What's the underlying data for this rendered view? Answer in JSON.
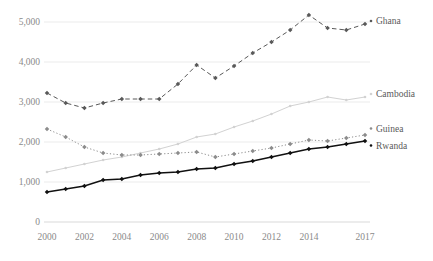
{
  "chart_data": {
    "type": "line",
    "title": "",
    "xlabel": "",
    "ylabel": "",
    "x": [
      2000,
      2001,
      2002,
      2003,
      2004,
      2005,
      2006,
      2007,
      2008,
      2009,
      2010,
      2011,
      2012,
      2013,
      2014,
      2015,
      2016,
      2017
    ],
    "xlim": [
      2000,
      2017
    ],
    "ylim": [
      0,
      5400
    ],
    "grid": true,
    "legend_position": "right-of-line-end",
    "xtick_labels": [
      "2000",
      "2002",
      "2004",
      "2006",
      "2008",
      "2010",
      "2012",
      "2014",
      "2017"
    ],
    "xtick_values": [
      2000,
      2002,
      2004,
      2006,
      2008,
      2010,
      2012,
      2014,
      2017
    ],
    "ytick_labels": [
      "0",
      "1,000",
      "2,000",
      "3,000",
      "4,000",
      "5,000"
    ],
    "ytick_values": [
      0,
      1000,
      2000,
      3000,
      4000,
      5000
    ],
    "series": [
      {
        "name": "Ghana",
        "label": "Ghana",
        "color": "#595959",
        "style": "dashed",
        "marker": "diamond",
        "values": [
          3225,
          2975,
          2850,
          2975,
          3075,
          3075,
          3075,
          3450,
          3925,
          3600,
          3900,
          4225,
          4500,
          4800,
          5175,
          4850,
          4800,
          4950
        ]
      },
      {
        "name": "Cambodia",
        "label": "Cambodia",
        "color": "#d2d2d2",
        "style": "solid",
        "marker": "circle",
        "values": [
          1250,
          1350,
          1450,
          1550,
          1625,
          1725,
          1825,
          1950,
          2125,
          2200,
          2375,
          2525,
          2700,
          2900,
          3000,
          3125,
          3050,
          3125
        ]
      },
      {
        "name": "Guinea",
        "label": "Guinea",
        "color": "#8c8c8c",
        "style": "dotted",
        "marker": "diamond",
        "values": [
          2325,
          2125,
          1875,
          1725,
          1675,
          1675,
          1700,
          1725,
          1750,
          1625,
          1700,
          1775,
          1850,
          1950,
          2050,
          2025,
          2100,
          2175
        ]
      },
      {
        "name": "Rwanda",
        "label": "Rwanda",
        "color": "#111111",
        "style": "solid",
        "marker": "diamond",
        "values": [
          750,
          825,
          900,
          1050,
          1075,
          1175,
          1225,
          1250,
          1325,
          1350,
          1450,
          1525,
          1625,
          1725,
          1825,
          1875,
          1950,
          2025
        ]
      }
    ]
  },
  "layout": {
    "plot_left": 47,
    "plot_right": 365,
    "plot_top": 12,
    "plot_bottom": 222
  }
}
